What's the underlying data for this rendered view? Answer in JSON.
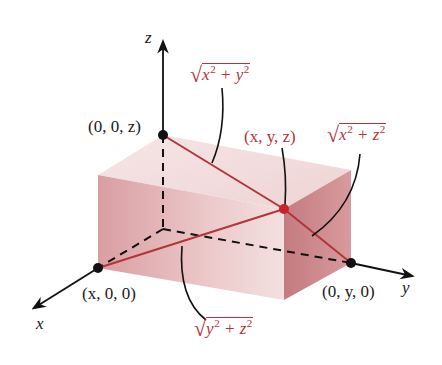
{
  "axes": {
    "x_label": "x",
    "y_label": "y",
    "z_label": "z"
  },
  "points": {
    "z_axis_point": "(0, 0, z)",
    "x_axis_point": "(x, 0, 0)",
    "y_axis_point": "(0, y, 0)",
    "corner_point": "(x, y, z)"
  },
  "distances": {
    "to_z_axis": {
      "var1": "x",
      "var2": "y",
      "exp": "2",
      "op": "+"
    },
    "to_y_axis": {
      "var1": "x",
      "var2": "z",
      "exp": "2",
      "op": "+"
    },
    "to_x_axis": {
      "var1": "y",
      "var2": "z",
      "exp": "2",
      "op": "+"
    }
  },
  "colors": {
    "box_front": "#e2b3b5",
    "box_top": "#f3dcdc",
    "box_right": "#c98488",
    "distance_line": "#b3343a",
    "axis": "#111111"
  }
}
